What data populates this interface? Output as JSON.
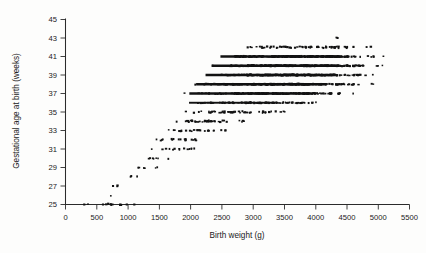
{
  "figure": {
    "title": "",
    "background_color": "#fdfdfc",
    "ink_color": "#121212"
  },
  "axis_titles": {
    "x": "Birth weight (g)",
    "y": "Gestational age at birth (weeks)"
  },
  "chart_data": {
    "type": "scatter",
    "title": "",
    "xlabel": "Birth weight (g)",
    "ylabel": "Gestational age at birth (weeks)",
    "xlim": [
      0,
      5500
    ],
    "ylim": [
      25,
      45
    ],
    "xticks": [
      0,
      500,
      1000,
      1500,
      2000,
      2500,
      3000,
      3500,
      4000,
      4500,
      5000,
      5500
    ],
    "yticks": [
      25,
      27,
      29,
      31,
      33,
      35,
      37,
      39,
      41,
      43,
      45
    ],
    "xtick_labels": [
      "0",
      "500",
      "1000",
      "1500",
      "2000",
      "2500",
      "3000",
      "3500",
      "4000",
      "4500",
      "5000",
      "5500"
    ],
    "ytick_labels": [
      "25",
      "27",
      "29",
      "31",
      "33",
      "35",
      "37",
      "39",
      "41",
      "43",
      "45"
    ],
    "grid": false,
    "legend": false,
    "marker": "square-dot",
    "marker_size_px": 1.6,
    "bands": [
      {
        "week": 25,
        "x_min": 200,
        "x_max": 1150,
        "density": "sparse",
        "n": 7
      },
      {
        "week": 26,
        "x_min": 700,
        "x_max": 760,
        "density": "sparse",
        "n": 1
      },
      {
        "week": 27,
        "x_min": 650,
        "x_max": 1000,
        "density": "sparse",
        "n": 2
      },
      {
        "week": 28,
        "x_min": 900,
        "x_max": 1200,
        "density": "sparse",
        "n": 3
      },
      {
        "week": 29,
        "x_min": 950,
        "x_max": 1600,
        "density": "sparse",
        "n": 6
      },
      {
        "week": 30,
        "x_min": 1050,
        "x_max": 1700,
        "density": "sparse",
        "n": 7
      },
      {
        "week": 31,
        "x_min": 1100,
        "x_max": 2250,
        "density": "light",
        "n": 14
      },
      {
        "week": 32,
        "x_min": 1200,
        "x_max": 2450,
        "density": "light",
        "n": 18
      },
      {
        "week": 33,
        "x_min": 1350,
        "x_max": 2750,
        "density": "light",
        "n": 24
      },
      {
        "week": 34,
        "x_min": 1500,
        "x_max": 3150,
        "density": "moderate",
        "n": 38
      },
      {
        "week": 35,
        "x_min": 1600,
        "x_max": 3900,
        "density": "moderate",
        "n": 52
      },
      {
        "week": 36,
        "x_min": 1700,
        "x_max": 4450,
        "density": "heavy",
        "n": 90
      },
      {
        "week": 37,
        "x_min": 1800,
        "x_max": 4800,
        "density": "very-heavy",
        "n": 160
      },
      {
        "week": 38,
        "x_min": 1900,
        "x_max": 5050,
        "density": "very-heavy",
        "n": 230
      },
      {
        "week": 39,
        "x_min": 2050,
        "x_max": 5200,
        "density": "very-heavy",
        "n": 260
      },
      {
        "week": 40,
        "x_min": 2150,
        "x_max": 5250,
        "density": "very-heavy",
        "n": 270
      },
      {
        "week": 41,
        "x_min": 2300,
        "x_max": 5250,
        "density": "very-heavy",
        "n": 220
      },
      {
        "week": 42,
        "x_min": 2600,
        "x_max": 5100,
        "density": "moderate",
        "n": 70
      },
      {
        "week": 43,
        "x_min": 4300,
        "x_max": 4380,
        "density": "sparse",
        "n": 1
      }
    ],
    "outliers": [
      {
        "x": 4350,
        "y": 43,
        "note": "single high-gestation point"
      },
      {
        "x": 760,
        "y": 27,
        "note": "low-weight early birth"
      }
    ],
    "floor_points_at_25_weeks": [
      300,
      600,
      750,
      880,
      980,
      1100
    ],
    "n_points_approx": 1470
  }
}
